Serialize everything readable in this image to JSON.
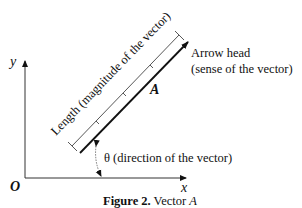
{
  "figure": {
    "caption_bold": "Figure 2.",
    "caption_rest": " Vector ",
    "caption_var": "A"
  },
  "axes": {
    "origin_label": "O",
    "x_label": "x",
    "y_label": "y"
  },
  "vector": {
    "name": "A",
    "length_label": "Length (magnitude of the vector)",
    "arrowhead_label_line1": "Arrow head",
    "arrowhead_label_line2": "(sense of the vector)",
    "angle_label": "θ (direction of the vector)"
  },
  "colors": {
    "ink": "#111111",
    "background": "#ffffff"
  }
}
